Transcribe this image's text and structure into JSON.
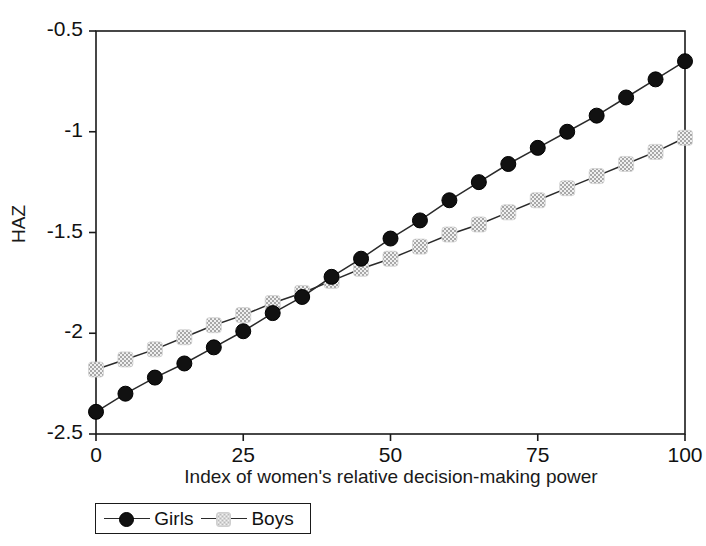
{
  "chart_data": {
    "type": "line",
    "title": "",
    "xlabel": "Index of women's relative decision-making power",
    "ylabel": "HAZ",
    "xlim": [
      0,
      100
    ],
    "ylim": [
      -2.5,
      -0.5
    ],
    "xticks": [
      "0",
      "25",
      "50",
      "75",
      "100"
    ],
    "xtick_values": [
      0,
      25,
      50,
      75,
      100
    ],
    "yticks": [
      "-0.5",
      "-1",
      "-1.5",
      "-2",
      "-2.5"
    ],
    "ytick_values": [
      -0.5,
      -1,
      -1.5,
      -2,
      -2.5
    ],
    "grid": false,
    "legend_position": "below-axes",
    "x": [
      0,
      5,
      10,
      15,
      20,
      25,
      30,
      35,
      40,
      45,
      50,
      55,
      60,
      65,
      70,
      75,
      80,
      85,
      90,
      95,
      100
    ],
    "series": [
      {
        "name": "Girls",
        "marker": "filled-circle",
        "color": "#111111",
        "values": [
          -2.39,
          -2.3,
          -2.22,
          -2.15,
          -2.07,
          -1.99,
          -1.9,
          -1.82,
          -1.72,
          -1.63,
          -1.53,
          -1.44,
          -1.34,
          -1.25,
          -1.16,
          -1.08,
          -1.0,
          -0.92,
          -0.83,
          -0.74,
          -0.65
        ]
      },
      {
        "name": "Boys",
        "marker": "hatched-square",
        "color": "#c4c4c4",
        "values": [
          -2.18,
          -2.13,
          -2.08,
          -2.02,
          -1.96,
          -1.91,
          -1.85,
          -1.8,
          -1.74,
          -1.68,
          -1.63,
          -1.57,
          -1.51,
          -1.46,
          -1.4,
          -1.34,
          -1.28,
          -1.22,
          -1.16,
          -1.1,
          -1.03
        ]
      }
    ]
  },
  "legend": {
    "items": [
      {
        "label": "Girls"
      },
      {
        "label": "Boys"
      }
    ]
  },
  "colors": {
    "axis": "#1a1a1a",
    "girls": "#111111",
    "boys": "#c4c4c4",
    "background": "#ffffff"
  }
}
